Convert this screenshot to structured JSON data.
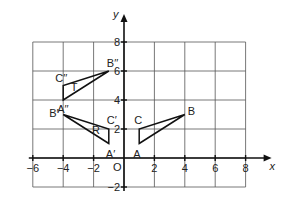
{
  "diagram": {
    "title": "",
    "axes": {
      "x_label": "x",
      "y_label": "y",
      "origin_label": "O",
      "x_ticks": [
        {
          "value": -6,
          "label": "−6"
        },
        {
          "value": -4,
          "label": "−4"
        },
        {
          "value": -2,
          "label": "−2"
        },
        {
          "value": 2,
          "label": "2"
        },
        {
          "value": 4,
          "label": "4"
        },
        {
          "value": 6,
          "label": "6"
        },
        {
          "value": 8,
          "label": "8"
        }
      ],
      "y_ticks": [
        {
          "value": 8,
          "label": "8"
        },
        {
          "value": 6,
          "label": "6"
        },
        {
          "value": 4,
          "label": "4"
        },
        {
          "value": 2,
          "label": "2"
        },
        {
          "value": -2,
          "label": "−2"
        }
      ],
      "grid_x_range": [
        -6,
        8
      ],
      "grid_y_range": [
        -2,
        8
      ],
      "grid_step": 2
    },
    "triangles": [
      {
        "name": "original",
        "label": "",
        "shaded": true,
        "vertices": [
          {
            "name": "A",
            "x": 1,
            "y": 1
          },
          {
            "name": "B",
            "x": 4,
            "y": 3
          },
          {
            "name": "C",
            "x": 1,
            "y": 2
          }
        ]
      },
      {
        "name": "image-R",
        "label": "R",
        "shaded": false,
        "vertices": [
          {
            "name": "A′",
            "x": -1,
            "y": 1
          },
          {
            "name": "B′",
            "x": -4,
            "y": 3
          },
          {
            "name": "C′",
            "x": -1,
            "y": 2
          }
        ]
      },
      {
        "name": "image-T",
        "label": "T",
        "shaded": false,
        "vertices": [
          {
            "name": "A′′",
            "x": -4,
            "y": 4
          },
          {
            "name": "B′′",
            "x": -1,
            "y": 6
          },
          {
            "name": "C′′",
            "x": -4,
            "y": 5
          }
        ]
      }
    ]
  }
}
